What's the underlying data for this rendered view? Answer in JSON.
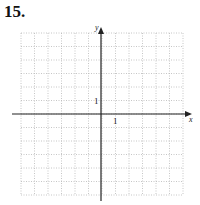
{
  "problem": {
    "number": "15."
  },
  "graph": {
    "x_axis_label": "x",
    "y_axis_label": "y",
    "x_tick_label": "1",
    "y_tick_label": "1",
    "grid": {
      "columns": 12,
      "rows": 12,
      "x_min": -6,
      "x_max": 6,
      "y_min": -6,
      "y_max": 6,
      "style": "dotted"
    },
    "colors": {
      "axis": "#222222",
      "grid": "#b8b8b8",
      "text": "#222222"
    }
  }
}
